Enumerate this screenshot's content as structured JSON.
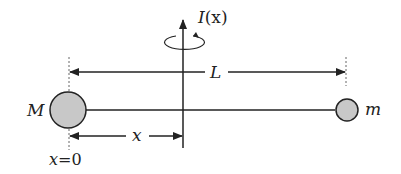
{
  "diagram": {
    "type": "physics-rod-rotation",
    "axis_label": {
      "main": "I",
      "arg": "(x)"
    },
    "length_label": "L",
    "distance_label": "x",
    "origin_label": {
      "var": "x",
      "eq": "=",
      "value": "0"
    },
    "mass_large": {
      "label": "M",
      "fill": "#c8c8c8"
    },
    "mass_small": {
      "label": "m",
      "fill": "#c8c8c8"
    },
    "colors": {
      "stroke": "#222222",
      "dashed": "#666666"
    }
  }
}
